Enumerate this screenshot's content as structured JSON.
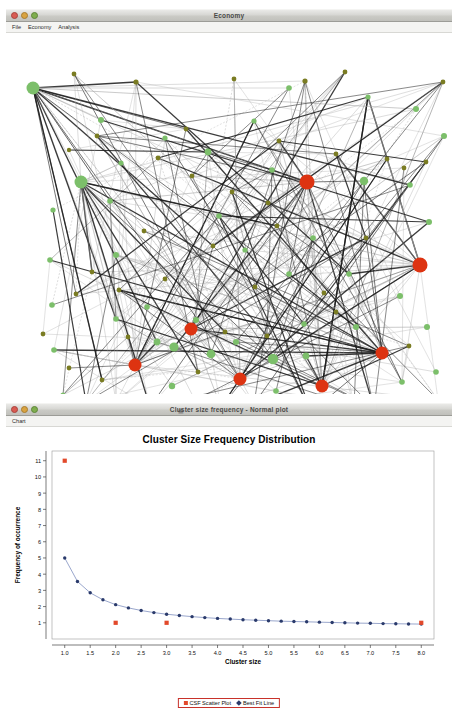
{
  "ghost_header": "",
  "window_economy": {
    "title": "Economy",
    "title_icon": "document-icon",
    "lights": [
      "close",
      "minimize",
      "maximize"
    ],
    "menu": [
      "File",
      "Economy",
      "Analysis"
    ],
    "network": {
      "description": "force-directed economic agent network",
      "colors": {
        "agent_node": "#7cbf6a",
        "small_node": "#7a7c22",
        "hub_node": "#dd3311",
        "edge_strong": "#1a1a1a",
        "edge_weak": "#a8a8a8"
      },
      "hub_nodes": [
        {
          "x": 301,
          "y": 158,
          "r": 7.5
        },
        {
          "x": 414,
          "y": 241,
          "r": 7.5
        },
        {
          "x": 185,
          "y": 305,
          "r": 6.5
        },
        {
          "x": 129,
          "y": 341,
          "r": 6.5
        },
        {
          "x": 234,
          "y": 355,
          "r": 6.5
        },
        {
          "x": 316,
          "y": 362,
          "r": 6.5
        },
        {
          "x": 376,
          "y": 329,
          "r": 6.5
        }
      ],
      "agent_nodes": [
        {
          "x": 27,
          "y": 64,
          "r": 6.5
        },
        {
          "x": 75,
          "y": 158,
          "r": 6.5
        },
        {
          "x": 95,
          "y": 96,
          "r": 3
        },
        {
          "x": 47,
          "y": 186,
          "r": 2.6
        },
        {
          "x": 44,
          "y": 236,
          "r": 2.8
        },
        {
          "x": 46,
          "y": 281,
          "r": 2.8
        },
        {
          "x": 48,
          "y": 326,
          "r": 2.8
        },
        {
          "x": 57,
          "y": 371,
          "r": 2.6
        },
        {
          "x": 80,
          "y": 378,
          "r": 3.4
        },
        {
          "x": 110,
          "y": 378,
          "r": 4.5
        },
        {
          "x": 144,
          "y": 383,
          "r": 3
        },
        {
          "x": 166,
          "y": 362,
          "r": 3.2
        },
        {
          "x": 189,
          "y": 376,
          "r": 3.4
        },
        {
          "x": 215,
          "y": 383,
          "r": 3
        },
        {
          "x": 248,
          "y": 380,
          "r": 2.8
        },
        {
          "x": 267,
          "y": 335,
          "r": 5.2
        },
        {
          "x": 205,
          "y": 330,
          "r": 4.4
        },
        {
          "x": 168,
          "y": 323,
          "r": 4.6
        },
        {
          "x": 151,
          "y": 318,
          "r": 3.4
        },
        {
          "x": 230,
          "y": 318,
          "r": 3
        },
        {
          "x": 190,
          "y": 296,
          "r": 3
        },
        {
          "x": 141,
          "y": 283,
          "r": 2.8
        },
        {
          "x": 110,
          "y": 295,
          "r": 2.8
        },
        {
          "x": 104,
          "y": 177,
          "r": 2.8
        },
        {
          "x": 110,
          "y": 231,
          "r": 3
        },
        {
          "x": 115,
          "y": 139,
          "r": 2.6
        },
        {
          "x": 159,
          "y": 114,
          "r": 2.6
        },
        {
          "x": 202,
          "y": 128,
          "r": 3.4
        },
        {
          "x": 248,
          "y": 97,
          "r": 2.6
        },
        {
          "x": 283,
          "y": 64,
          "r": 2.8
        },
        {
          "x": 266,
          "y": 146,
          "r": 2.8
        },
        {
          "x": 307,
          "y": 214,
          "r": 2.8
        },
        {
          "x": 358,
          "y": 157,
          "r": 4.2
        },
        {
          "x": 404,
          "y": 161,
          "r": 2.8
        },
        {
          "x": 423,
          "y": 198,
          "r": 3
        },
        {
          "x": 438,
          "y": 112,
          "r": 3
        },
        {
          "x": 410,
          "y": 85,
          "r": 3
        },
        {
          "x": 362,
          "y": 73,
          "r": 2.6
        },
        {
          "x": 394,
          "y": 272,
          "r": 3
        },
        {
          "x": 421,
          "y": 303,
          "r": 3
        },
        {
          "x": 350,
          "y": 303,
          "r": 3
        },
        {
          "x": 298,
          "y": 300,
          "r": 2.8
        },
        {
          "x": 343,
          "y": 250,
          "r": 2.8
        },
        {
          "x": 283,
          "y": 250,
          "r": 2.8
        },
        {
          "x": 239,
          "y": 226,
          "r": 2.6
        },
        {
          "x": 213,
          "y": 192,
          "r": 2.8
        },
        {
          "x": 300,
          "y": 332,
          "r": 3.4
        },
        {
          "x": 270,
          "y": 367,
          "r": 2.8
        },
        {
          "x": 348,
          "y": 382,
          "r": 3
        },
        {
          "x": 396,
          "y": 358,
          "r": 2.8
        },
        {
          "x": 430,
          "y": 348,
          "r": 2.8
        }
      ],
      "small_nodes": [
        {
          "x": 68,
          "y": 50,
          "r": 2.4
        },
        {
          "x": 130,
          "y": 58,
          "r": 2.6
        },
        {
          "x": 228,
          "y": 55,
          "r": 2.4
        },
        {
          "x": 299,
          "y": 57,
          "r": 2.6
        },
        {
          "x": 339,
          "y": 48,
          "r": 2.4
        },
        {
          "x": 437,
          "y": 58,
          "r": 2.4
        },
        {
          "x": 91,
          "y": 112,
          "r": 2.4
        },
        {
          "x": 63,
          "y": 126,
          "r": 2.2
        },
        {
          "x": 152,
          "y": 134,
          "r": 2.4
        },
        {
          "x": 180,
          "y": 105,
          "r": 2.4
        },
        {
          "x": 273,
          "y": 117,
          "r": 2.4
        },
        {
          "x": 186,
          "y": 152,
          "r": 2.4
        },
        {
          "x": 226,
          "y": 168,
          "r": 2.4
        },
        {
          "x": 262,
          "y": 179,
          "r": 2.4
        },
        {
          "x": 330,
          "y": 130,
          "r": 2.4
        },
        {
          "x": 381,
          "y": 135,
          "r": 2.4
        },
        {
          "x": 398,
          "y": 144,
          "r": 2.4
        },
        {
          "x": 420,
          "y": 138,
          "r": 2.4
        },
        {
          "x": 271,
          "y": 202,
          "r": 2.4
        },
        {
          "x": 207,
          "y": 222,
          "r": 2.4
        },
        {
          "x": 138,
          "y": 207,
          "r": 2.4
        },
        {
          "x": 86,
          "y": 248,
          "r": 2.4
        },
        {
          "x": 70,
          "y": 270,
          "r": 2.4
        },
        {
          "x": 113,
          "y": 266,
          "r": 2.4
        },
        {
          "x": 159,
          "y": 255,
          "r": 2.4
        },
        {
          "x": 249,
          "y": 263,
          "r": 2.4
        },
        {
          "x": 318,
          "y": 269,
          "r": 2.4
        },
        {
          "x": 360,
          "y": 214,
          "r": 2.4
        },
        {
          "x": 122,
          "y": 313,
          "r": 2.4
        },
        {
          "x": 192,
          "y": 348,
          "r": 2.4
        },
        {
          "x": 219,
          "y": 308,
          "r": 2.4
        },
        {
          "x": 261,
          "y": 312,
          "r": 2.4
        },
        {
          "x": 330,
          "y": 288,
          "r": 2.4
        },
        {
          "x": 403,
          "y": 322,
          "r": 2.4
        },
        {
          "x": 432,
          "y": 376,
          "r": 2.4
        },
        {
          "x": 368,
          "y": 384,
          "r": 2.4
        },
        {
          "x": 305,
          "y": 388,
          "r": 2.4
        },
        {
          "x": 96,
          "y": 356,
          "r": 2.4
        },
        {
          "x": 63,
          "y": 344,
          "r": 2.4
        },
        {
          "x": 37,
          "y": 310,
          "r": 2.4
        }
      ]
    }
  },
  "window_chart": {
    "title": "Cluster size frequency - Normal plot",
    "title_icon": "chart-icon",
    "lights": [
      "close",
      "minimize",
      "maximize"
    ],
    "menu": [
      "Chart"
    ]
  },
  "chart_data": {
    "type": "scatter",
    "title": "Cluster Size Frequency Distribution",
    "xlabel": "Cluster size",
    "ylabel": "Frequency of occurrence",
    "xlim": [
      0.75,
      8.25
    ],
    "ylim": [
      0,
      11.6
    ],
    "xticks": [
      "1.0",
      "1.5",
      "2.0",
      "2.5",
      "3.0",
      "3.5",
      "4.0",
      "4.5",
      "5.0",
      "5.5",
      "6.0",
      "6.5",
      "7.0",
      "7.5",
      "8.0"
    ],
    "xtick_values": [
      1.0,
      1.5,
      2.0,
      2.5,
      3.0,
      3.5,
      4.0,
      4.5,
      5.0,
      5.5,
      6.0,
      6.5,
      7.0,
      7.5,
      8.0
    ],
    "yticks": [
      "1",
      "2",
      "3",
      "4",
      "5",
      "6",
      "7",
      "8",
      "9",
      "10",
      "11"
    ],
    "ytick_values": [
      1,
      2,
      3,
      4,
      5,
      6,
      7,
      8,
      9,
      10,
      11
    ],
    "grid": false,
    "legend_position": "bottom-center",
    "series": [
      {
        "name": "CSF Scatter Plot",
        "marker": "square",
        "color": "#e2492b",
        "x": [
          1.0,
          2.0,
          3.0,
          8.0
        ],
        "y": [
          11,
          1,
          1,
          1
        ]
      },
      {
        "name": "Best Fit Line",
        "marker": "diamond",
        "color": "#2a3a6b",
        "line": true,
        "x": [
          1.0,
          1.25,
          1.5,
          1.75,
          2.0,
          2.25,
          2.5,
          2.75,
          3.0,
          3.25,
          3.5,
          3.75,
          4.0,
          4.25,
          4.5,
          4.75,
          5.0,
          5.25,
          5.5,
          5.75,
          6.0,
          6.25,
          6.5,
          6.75,
          7.0,
          7.25,
          7.5,
          7.75,
          8.0
        ],
        "y": [
          5.0,
          3.55,
          2.85,
          2.42,
          2.12,
          1.92,
          1.76,
          1.63,
          1.53,
          1.45,
          1.38,
          1.32,
          1.27,
          1.23,
          1.19,
          1.16,
          1.13,
          1.1,
          1.08,
          1.06,
          1.04,
          1.02,
          1.0,
          0.98,
          0.97,
          0.95,
          0.94,
          0.93,
          0.92
        ]
      }
    ]
  }
}
